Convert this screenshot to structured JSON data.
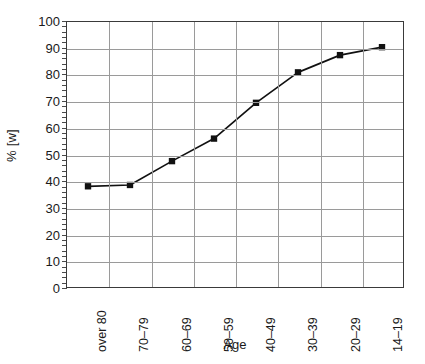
{
  "chart_data": {
    "type": "line",
    "title": "",
    "xlabel": "Age",
    "ylabel": "% [w]",
    "categories": [
      "over 80",
      "70–79",
      "60–69",
      "50–59",
      "40–49",
      "30–39",
      "20–29",
      "14–19"
    ],
    "values": [
      38,
      38.5,
      47.5,
      56,
      69.5,
      81,
      87.5,
      90.5
    ],
    "series": [
      {
        "name": "% [w]",
        "values": [
          38,
          38.5,
          47.5,
          56,
          69.5,
          81,
          87.5,
          90.5
        ]
      }
    ],
    "ylim": [
      0,
      100
    ],
    "ytick_labels": [
      "100",
      "90",
      "80",
      "70",
      "60",
      "50",
      "40",
      "30",
      "20",
      "10",
      "0"
    ],
    "ytick_values": [
      100,
      90,
      80,
      70,
      60,
      50,
      40,
      30,
      20,
      10,
      0
    ],
    "ytick_step": 10,
    "y_minor_step": 2,
    "grid": "both",
    "legend": "none",
    "marker": "square",
    "marker_color": "#111111",
    "line_color": "#111111",
    "grid_color": "#9a9a9a",
    "frame_color": "#3a3a3a"
  }
}
